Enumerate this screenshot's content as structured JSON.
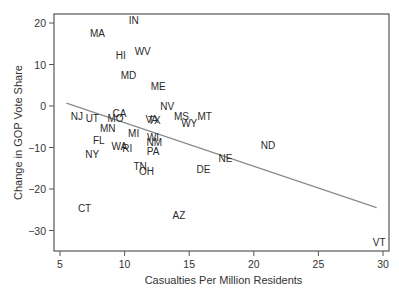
{
  "chart_data": {
    "type": "scatter",
    "title": "",
    "xlabel": "Casualties Per Million Residents",
    "ylabel": "Change in GOP Vote Share",
    "xlim": [
      4.5,
      30.5
    ],
    "ylim": [
      -35,
      22.5
    ],
    "xticks": [
      5,
      10,
      15,
      20,
      25,
      30
    ],
    "yticks": [
      20,
      10,
      0,
      -10,
      -20,
      -30
    ],
    "xtick_labels": [
      "5",
      "10",
      "15",
      "20",
      "25",
      "30"
    ],
    "ytick_labels": [
      "20",
      "10",
      "0",
      "−10",
      "−20",
      "−30"
    ],
    "grid": false,
    "legend": null,
    "marker": "text-label",
    "points": [
      {
        "label": "IN",
        "x": 10.7,
        "y": 20.6
      },
      {
        "label": "MA",
        "x": 7.9,
        "y": 17.5
      },
      {
        "label": "HI",
        "x": 9.7,
        "y": 12.2
      },
      {
        "label": "WV",
        "x": 11.4,
        "y": 13.2
      },
      {
        "label": "MD",
        "x": 10.3,
        "y": 7.4
      },
      {
        "label": "ME",
        "x": 12.6,
        "y": 4.8
      },
      {
        "label": "NV",
        "x": 13.3,
        "y": 0.0
      },
      {
        "label": "CA",
        "x": 9.6,
        "y": -1.9
      },
      {
        "label": "MO",
        "x": 9.3,
        "y": -2.9
      },
      {
        "label": "NJ",
        "x": 6.3,
        "y": -2.6
      },
      {
        "label": "UT",
        "x": 7.5,
        "y": -2.9
      },
      {
        "label": "VA",
        "x": 12.1,
        "y": -3.3
      },
      {
        "label": "TX",
        "x": 12.3,
        "y": -3.5
      },
      {
        "label": "MS",
        "x": 14.4,
        "y": -2.6
      },
      {
        "label": "WY",
        "x": 15.0,
        "y": -4.1
      },
      {
        "label": "MT",
        "x": 16.2,
        "y": -2.6
      },
      {
        "label": "MN",
        "x": 8.7,
        "y": -5.5
      },
      {
        "label": "MI",
        "x": 10.7,
        "y": -6.7
      },
      {
        "label": "WI",
        "x": 12.2,
        "y": -7.7
      },
      {
        "label": "NM",
        "x": 12.3,
        "y": -8.9
      },
      {
        "label": "FL",
        "x": 8.0,
        "y": -8.4
      },
      {
        "label": "WA",
        "x": 9.6,
        "y": -9.8
      },
      {
        "label": "RI",
        "x": 10.2,
        "y": -10.3
      },
      {
        "label": "PA",
        "x": 12.2,
        "y": -11.0
      },
      {
        "label": "NY",
        "x": 7.5,
        "y": -11.8
      },
      {
        "label": "TN",
        "x": 11.2,
        "y": -14.6
      },
      {
        "label": "OH",
        "x": 11.7,
        "y": -15.8
      },
      {
        "label": "DE",
        "x": 16.1,
        "y": -15.3
      },
      {
        "label": "NE",
        "x": 17.8,
        "y": -12.7
      },
      {
        "label": "ND",
        "x": 21.1,
        "y": -9.4
      },
      {
        "label": "CT",
        "x": 6.9,
        "y": -24.7
      },
      {
        "label": "AZ",
        "x": 14.2,
        "y": -26.4
      },
      {
        "label": "VT",
        "x": 29.7,
        "y": -32.9
      }
    ],
    "fit_line": {
      "type": "linear",
      "start": {
        "x": 5.5,
        "y": 0.7
      },
      "end": {
        "x": 29.5,
        "y": -24.5
      },
      "color": "#8a8a8a"
    },
    "colors": {
      "axis": "#555555",
      "text": "#2a2a2a",
      "fit_line": "#8a8a8a",
      "background": "#ffffff"
    }
  }
}
